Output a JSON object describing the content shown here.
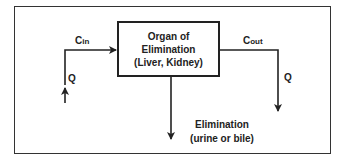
{
  "diagram": {
    "organ_box": {
      "line1": "Organ of",
      "line2": "Elimination",
      "line3": "(Liver, Kidney)"
    },
    "inflow": {
      "concentration_base": "C",
      "concentration_sub": "in",
      "flow_label": "Q"
    },
    "outflow": {
      "concentration_base": "C",
      "concentration_sub": "out",
      "flow_label": "Q"
    },
    "elimination": {
      "line1": "Elimination",
      "line2": "(urine or bile)"
    },
    "colors": {
      "stroke": "#222222",
      "background": "#ffffff"
    }
  }
}
